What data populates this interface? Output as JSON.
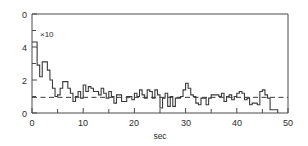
{
  "chart_data": {
    "type": "line",
    "subtype": "step-post",
    "title": "",
    "xlabel": "sec",
    "ylabel": "",
    "annotation": "×10",
    "annotations": [
      "×10"
    ],
    "xlim": [
      0,
      50
    ],
    "ylim": [
      0,
      6
    ],
    "grid": false,
    "legend": null,
    "xticks": [
      0,
      5,
      10,
      15,
      20,
      25,
      30,
      35,
      40,
      45,
      50
    ],
    "xticklabels": [
      "0",
      "",
      "10",
      "",
      "20",
      "",
      "30",
      "",
      "40",
      "",
      "50"
    ],
    "yticks": [
      0,
      1,
      2,
      3,
      4,
      5,
      6
    ],
    "yticklabels": [
      "0",
      "",
      "2",
      "",
      "4",
      "",
      "0"
    ],
    "reference_line": {
      "orientation": "horizontal",
      "value": 0.95,
      "style": "dashed",
      "color": "#3a3a3a"
    },
    "line_color": "#3a3a3a",
    "series": [
      {
        "name": "rate",
        "x": [
          0.0,
          0.5,
          1.0,
          1.5,
          2.0,
          2.5,
          3.0,
          3.5,
          4.0,
          4.5,
          5.0,
          5.5,
          6.0,
          6.5,
          7.0,
          7.5,
          8.0,
          8.5,
          9.0,
          9.5,
          10.0,
          10.5,
          11.0,
          11.5,
          12.0,
          12.5,
          13.0,
          13.5,
          14.0,
          14.5,
          15.0,
          15.5,
          16.0,
          16.5,
          17.0,
          17.5,
          18.0,
          18.5,
          19.0,
          19.5,
          20.0,
          20.5,
          21.0,
          21.5,
          22.0,
          22.5,
          23.0,
          23.5,
          24.0,
          24.5,
          25.0,
          25.5,
          26.0,
          26.5,
          27.0,
          27.5,
          28.0,
          28.5,
          29.0,
          29.5,
          30.0,
          30.5,
          31.0,
          31.5,
          32.0,
          32.5,
          33.0,
          33.5,
          34.0,
          34.5,
          35.0,
          35.5,
          36.0,
          36.5,
          37.0,
          37.5,
          38.0,
          38.5,
          39.0,
          39.5,
          40.0,
          40.5,
          41.0,
          41.5,
          42.0,
          42.5,
          43.0,
          43.5,
          44.0,
          44.5,
          45.0,
          45.5,
          46.0,
          46.5,
          47.0,
          47.5
        ],
        "values": [
          4.3,
          4.3,
          2.9,
          2.2,
          3.1,
          3.1,
          2.6,
          2.0,
          1.5,
          1.0,
          1.1,
          1.5,
          1.9,
          1.9,
          1.5,
          1.2,
          0.7,
          1.0,
          1.3,
          0.9,
          1.7,
          1.3,
          1.6,
          1.5,
          1.3,
          1.3,
          1.1,
          1.5,
          1.2,
          0.9,
          1.3,
          1.0,
          0.6,
          1.1,
          1.1,
          0.7,
          0.7,
          1.0,
          1.0,
          0.8,
          1.2,
          1.0,
          1.4,
          1.1,
          0.9,
          1.4,
          1.3,
          0.9,
          1.4,
          1.1,
          0.3,
          0.9,
          1.2,
          0.4,
          1.0,
          0.4,
          0.9,
          0.9,
          1.0,
          1.4,
          1.8,
          1.5,
          1.1,
          1.0,
          0.6,
          0.5,
          0.9,
          0.9,
          0.5,
          0.9,
          1.1,
          1.1,
          1.1,
          1.0,
          1.2,
          0.7,
          1.0,
          1.1,
          0.8,
          1.0,
          1.2,
          1.3,
          1.2,
          0.8,
          0.9,
          0.5,
          0.6,
          0.6,
          0.5,
          1.3,
          1.4,
          1.1,
          0.9,
          0.2,
          0.2,
          0.2
        ]
      }
    ]
  },
  "axes": {
    "x_label": "sec",
    "x_tick_labels": [
      "0",
      "10",
      "20",
      "30",
      "40",
      "50"
    ],
    "x_tick_values": [
      0,
      10,
      20,
      30,
      40,
      50
    ],
    "y_tick_labels": [
      "0",
      "2",
      "4",
      "0"
    ],
    "y_tick_values": [
      0,
      2,
      4,
      6
    ],
    "multiplier_note": "×10"
  }
}
